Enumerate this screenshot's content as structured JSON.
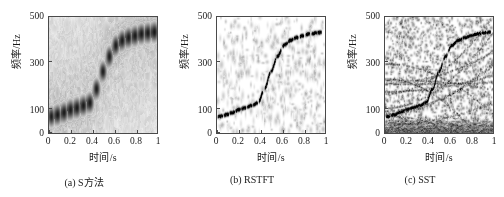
{
  "figure": {
    "type": "time-frequency-distribution-comparison",
    "panel_count": 3
  },
  "axes": {
    "xlabel": "时间/s",
    "ylabel": "频率/Hz",
    "xticks": [
      "0",
      "0.2",
      "0.4",
      "0.6",
      "0.8",
      "1"
    ],
    "xtick_values": [
      0,
      0.2,
      0.4,
      0.6,
      0.8,
      1
    ],
    "yticks": [
      "0",
      "100",
      "300",
      "500"
    ],
    "ytick_values": [
      0,
      100,
      300,
      500
    ],
    "xlim": [
      0,
      1
    ],
    "ylim": [
      0,
      500
    ],
    "grid": false,
    "colormap": "grayscale-inverted",
    "background_color": "#ffffff",
    "ink_color": "#000000",
    "frame_color": "#4a4a4a"
  },
  "panels": [
    {
      "id": "panel-a",
      "caption": "(a) S方法",
      "method": "S方法",
      "description": "blurred elliptical energy blobs forming a staircase ridge with heavy background smear"
    },
    {
      "id": "panel-b",
      "caption": "(b) RSTFT",
      "method": "RSTFT",
      "description": "thin sharp slanted streaks tracing the same ridge, low background"
    },
    {
      "id": "panel-c",
      "caption": "(c) SST",
      "method": "SST",
      "description": "concentrated ridge plus many spurious curved harmonic trajectories across the plane"
    }
  ],
  "chart_data": {
    "type": "heatmap",
    "title": "",
    "xlabel": "时间/s",
    "ylabel": "频率/Hz",
    "xlim": [
      0,
      1
    ],
    "ylim": [
      0,
      500
    ],
    "grid": false,
    "legend": "none",
    "series": [
      {
        "name": "S方法",
        "panel": "a",
        "ridge_t": [
          0.02,
          0.08,
          0.14,
          0.2,
          0.26,
          0.32,
          0.38,
          0.44,
          0.5,
          0.56,
          0.62,
          0.68,
          0.74,
          0.8,
          0.86,
          0.92,
          0.98
        ],
        "ridge_f": [
          70,
          78,
          88,
          100,
          108,
          118,
          130,
          190,
          265,
          330,
          378,
          400,
          412,
          420,
          428,
          432,
          436
        ],
        "blob_sigma_t": 0.022,
        "blob_sigma_f": 26
      },
      {
        "name": "RSTFT",
        "panel": "b",
        "ridge_t": [
          0.02,
          0.08,
          0.14,
          0.2,
          0.26,
          0.32,
          0.38,
          0.44,
          0.5,
          0.56,
          0.62,
          0.68,
          0.74,
          0.8,
          0.86,
          0.92,
          0.98
        ],
        "ridge_f": [
          70,
          78,
          88,
          100,
          108,
          118,
          130,
          190,
          265,
          330,
          378,
          400,
          412,
          420,
          428,
          432,
          436
        ],
        "blob_sigma_t": 0.01,
        "blob_sigma_f": 9
      },
      {
        "name": "SST",
        "panel": "c",
        "ridge_t": [
          0.02,
          0.08,
          0.14,
          0.2,
          0.26,
          0.32,
          0.38,
          0.44,
          0.5,
          0.56,
          0.62,
          0.68,
          0.74,
          0.8,
          0.86,
          0.92,
          0.98
        ],
        "ridge_f": [
          70,
          78,
          88,
          100,
          108,
          118,
          130,
          190,
          265,
          330,
          378,
          400,
          412,
          420,
          428,
          432,
          436
        ],
        "blob_sigma_t": 0.009,
        "blob_sigma_f": 8,
        "spurious_curves": 14
      }
    ]
  }
}
